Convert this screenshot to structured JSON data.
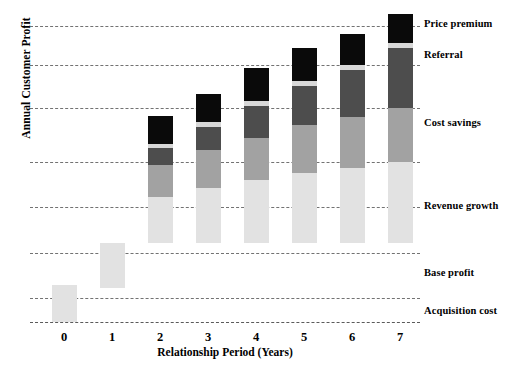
{
  "chart_data": {
    "type": "bar",
    "subtype": "stacked-bar",
    "title": "",
    "xlabel": "Relationship Period (Years)",
    "ylabel": "Annual Customer Profit",
    "categories": [
      "0",
      "1",
      "2",
      "3",
      "4",
      "5",
      "6",
      "7"
    ],
    "grid": true,
    "gridlines_y": [
      7,
      6,
      5,
      4,
      3,
      2,
      1,
      0
    ],
    "ylim": [
      -1,
      7
    ],
    "yticks_shown": false,
    "legend_position": "right-inline-annotations",
    "series": [
      {
        "name": "Acquisition cost",
        "color": "#e2e2e2",
        "values": [
          -1.0,
          0,
          0,
          0,
          0,
          0,
          0,
          0
        ]
      },
      {
        "name": "Base profit",
        "color": "#e2e2e2",
        "values": [
          0,
          1.0,
          1.3,
          1.4,
          1.5,
          1.55,
          1.6,
          1.65
        ]
      },
      {
        "name": "Revenue growth",
        "color": "#a2a2a2",
        "values": [
          0,
          0,
          0.9,
          1.1,
          1.2,
          1.35,
          1.45,
          1.55
        ]
      },
      {
        "name": "Cost savings",
        "color": "#4d4d4d",
        "values": [
          0,
          0,
          0.5,
          0.7,
          0.9,
          1.1,
          1.3,
          1.5
        ]
      },
      {
        "name": "Referral",
        "color": "#d8d8d8",
        "values": [
          0,
          0,
          0.08,
          0.08,
          0.08,
          0.09,
          0.09,
          0.1
        ]
      },
      {
        "name": "Price premium",
        "color": "#0a0a0a",
        "values": [
          0,
          0,
          0.85,
          0.95,
          1.15,
          1.25,
          1.35,
          1.45
        ]
      }
    ],
    "annotations": [
      {
        "text": "Price premium",
        "y_px": 18
      },
      {
        "text": "Referral",
        "y_px": 49
      },
      {
        "text": "Cost savings",
        "y_px": 117
      },
      {
        "text": "Revenue growth",
        "y_px": 200
      },
      {
        "text": "Base profit",
        "y_px": 267
      },
      {
        "text": "Acquisition cost",
        "y_px": 305
      }
    ]
  },
  "axis": {
    "y_title": "Annual Customer Profit",
    "x_title": "Relationship Period (Years)",
    "x_ticks": [
      "0",
      "1",
      "2",
      "3",
      "4",
      "5",
      "6",
      "7"
    ]
  },
  "legend": {
    "items": [
      "Price premium",
      "Referral",
      "Cost savings",
      "Revenue growth",
      "Base profit",
      "Acquisition cost"
    ]
  },
  "geometry": {
    "gridline_y_px": [
      16,
      55,
      98,
      152,
      197,
      243,
      288
    ],
    "baseline_y_px": 312,
    "bar_x_px": [
      22,
      70,
      118,
      166,
      214,
      262,
      310,
      358
    ],
    "bars": [
      {
        "cat": "0",
        "segments": [
          {
            "name": "Acquisition cost",
            "top": 275,
            "bottom": 312,
            "color": "#e2e2e2"
          }
        ]
      },
      {
        "cat": "1",
        "segments": [
          {
            "name": "Base profit",
            "top": 233,
            "bottom": 278,
            "color": "#e2e2e2"
          }
        ]
      },
      {
        "cat": "2",
        "segments": [
          {
            "name": "Base profit",
            "top": 187,
            "bottom": 233,
            "color": "#e2e2e2"
          },
          {
            "name": "Revenue growth",
            "top": 155,
            "bottom": 187,
            "color": "#a2a2a2"
          },
          {
            "name": "Cost savings",
            "top": 138,
            "bottom": 155,
            "color": "#4d4d4d"
          },
          {
            "name": "Referral",
            "top": 134,
            "bottom": 138,
            "color": "#d8d8d8"
          },
          {
            "name": "Price premium",
            "top": 106,
            "bottom": 134,
            "color": "#0a0a0a"
          }
        ]
      },
      {
        "cat": "3",
        "segments": [
          {
            "name": "Base profit",
            "top": 178,
            "bottom": 233,
            "color": "#e2e2e2"
          },
          {
            "name": "Revenue growth",
            "top": 140,
            "bottom": 178,
            "color": "#a2a2a2"
          },
          {
            "name": "Cost savings",
            "top": 117,
            "bottom": 140,
            "color": "#4d4d4d"
          },
          {
            "name": "Referral",
            "top": 112,
            "bottom": 117,
            "color": "#d8d8d8"
          },
          {
            "name": "Price premium",
            "top": 84,
            "bottom": 112,
            "color": "#0a0a0a"
          }
        ]
      },
      {
        "cat": "4",
        "segments": [
          {
            "name": "Base profit",
            "top": 170,
            "bottom": 233,
            "color": "#e2e2e2"
          },
          {
            "name": "Revenue growth",
            "top": 128,
            "bottom": 170,
            "color": "#a2a2a2"
          },
          {
            "name": "Cost savings",
            "top": 96,
            "bottom": 128,
            "color": "#4d4d4d"
          },
          {
            "name": "Referral",
            "top": 91,
            "bottom": 96,
            "color": "#d8d8d8"
          },
          {
            "name": "Price premium",
            "top": 58,
            "bottom": 91,
            "color": "#0a0a0a"
          }
        ]
      },
      {
        "cat": "5",
        "segments": [
          {
            "name": "Base profit",
            "top": 163,
            "bottom": 233,
            "color": "#e2e2e2"
          },
          {
            "name": "Revenue growth",
            "top": 115,
            "bottom": 163,
            "color": "#a2a2a2"
          },
          {
            "name": "Cost savings",
            "top": 76,
            "bottom": 115,
            "color": "#4d4d4d"
          },
          {
            "name": "Referral",
            "top": 71,
            "bottom": 76,
            "color": "#d8d8d8"
          },
          {
            "name": "Price premium",
            "top": 38,
            "bottom": 71,
            "color": "#0a0a0a"
          }
        ]
      },
      {
        "cat": "6",
        "segments": [
          {
            "name": "Base profit",
            "top": 158,
            "bottom": 233,
            "color": "#e2e2e2"
          },
          {
            "name": "Revenue growth",
            "top": 107,
            "bottom": 158,
            "color": "#a2a2a2"
          },
          {
            "name": "Cost savings",
            "top": 60,
            "bottom": 107,
            "color": "#4d4d4d"
          },
          {
            "name": "Referral",
            "top": 55,
            "bottom": 60,
            "color": "#d8d8d8"
          },
          {
            "name": "Price premium",
            "top": 24,
            "bottom": 55,
            "color": "#0a0a0a"
          }
        ]
      },
      {
        "cat": "7",
        "segments": [
          {
            "name": "Base profit",
            "top": 152,
            "bottom": 233,
            "color": "#e2e2e2"
          },
          {
            "name": "Revenue growth",
            "top": 98,
            "bottom": 152,
            "color": "#a2a2a2"
          },
          {
            "name": "Cost savings",
            "top": 38,
            "bottom": 98,
            "color": "#4d4d4d"
          },
          {
            "name": "Referral",
            "top": 33,
            "bottom": 38,
            "color": "#d8d8d8"
          },
          {
            "name": "Price premium",
            "top": 4,
            "bottom": 33,
            "color": "#0a0a0a"
          }
        ]
      }
    ]
  }
}
